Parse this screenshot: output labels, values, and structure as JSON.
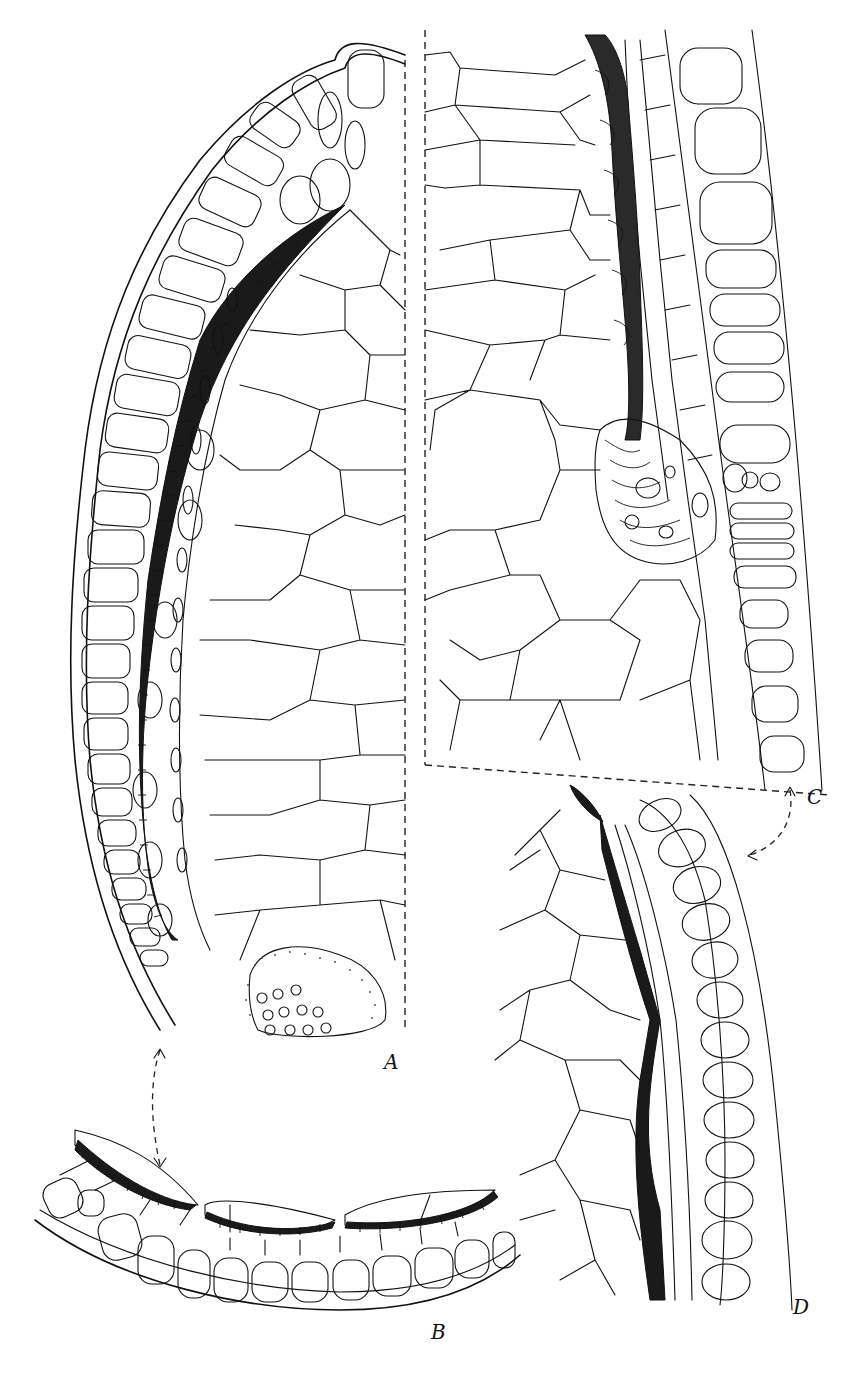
{
  "figure": {
    "caption_fragment": "",
    "panels": [
      {
        "id": "A",
        "label": "A",
        "description": "longitudinal section of axis apex: epidermis, cortex with hatched endodermal band, large parenchyma cells, vascular strand with stippling"
      },
      {
        "id": "B",
        "label": "B",
        "description": "curved epidermal strip with three hatched lens-shaped thickenings"
      },
      {
        "id": "C",
        "label": "C",
        "description": "section showing large parenchyma cells, fibrous lamellate band with protrusions, elongate epidermal cells"
      },
      {
        "id": "D",
        "label": "D",
        "description": "section with heavily thickened dark band between polygonal cells and outer row of oval epidermal cells"
      }
    ],
    "connectors": [
      {
        "from": "A",
        "to": "B",
        "style": "dashed-curved-double-arrow"
      },
      {
        "from": "C",
        "to": "D",
        "style": "dashed-curved-double-arrow"
      }
    ],
    "colors": {
      "ink": "#111111",
      "background": "#ffffff"
    }
  }
}
